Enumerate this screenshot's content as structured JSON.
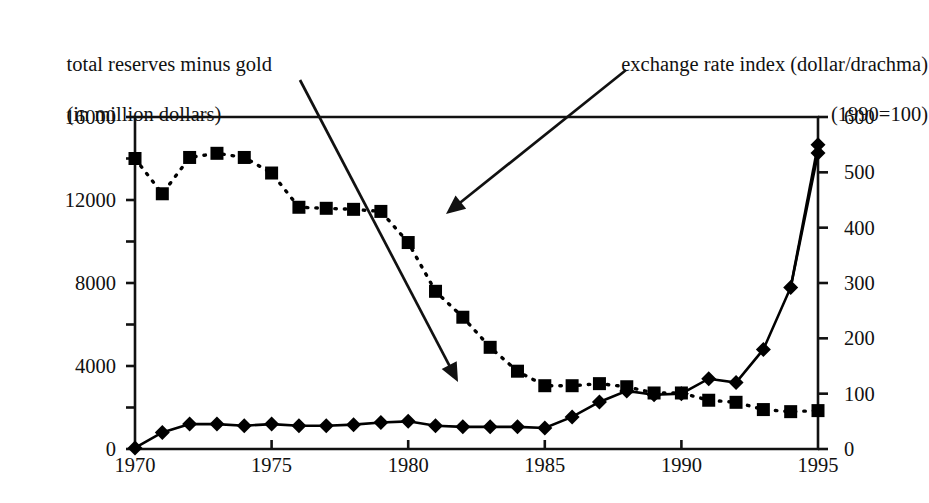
{
  "chart_data": {
    "type": "line",
    "title": "",
    "xlabel": "",
    "x": [
      1970,
      1971,
      1972,
      1973,
      1974,
      1975,
      1976,
      1977,
      1978,
      1979,
      1980,
      1981,
      1982,
      1983,
      1984,
      1985,
      1986,
      1987,
      1988,
      1989,
      1990,
      1991,
      1992,
      1993,
      1994,
      1995
    ],
    "xlim": [
      1970,
      1995
    ],
    "xticks": [
      "1970",
      "1975",
      "1980",
      "1985",
      "1990",
      "1995"
    ],
    "xtick_values": [
      1970,
      1975,
      1980,
      1985,
      1990,
      1995
    ],
    "grid": false,
    "legend_position": "annotated-with-arrows",
    "axes": [
      {
        "side": "left",
        "label": "total reserves minus gold\n(in million dollars)",
        "label_line1": "total reserves minus gold",
        "label_line2": "(in million dollars)",
        "ylim": [
          0,
          16000
        ],
        "yticks": [
          "0",
          "4000",
          "8000",
          "12000",
          "16000"
        ],
        "ytick_values": [
          0,
          4000,
          8000,
          12000,
          16000
        ]
      },
      {
        "side": "right",
        "label": "exchange rate index (dollar/drachma)\n(1990=100)",
        "label_line1": "exchange rate index (dollar/drachma)",
        "label_line2": "(1990=100)",
        "ylim": [
          0,
          600
        ],
        "yticks": [
          "0",
          "100",
          "200",
          "300",
          "400",
          "500",
          "600"
        ],
        "ytick_values": [
          0,
          100,
          200,
          300,
          400,
          500,
          600
        ]
      }
    ],
    "series": [
      {
        "name": "total reserves minus gold (in million dollars)",
        "axis": "left",
        "marker": "square",
        "linestyle": "dotted",
        "color": "#000000",
        "values": [
          14000,
          12300,
          14050,
          14250,
          14050,
          13300,
          11650,
          11600,
          11550,
          11450,
          9950,
          7600,
          6350,
          4900,
          3750,
          3050,
          3050,
          3150,
          3000,
          2700,
          2700,
          2350,
          2250,
          1900,
          1800,
          1850
        ]
      },
      {
        "name": "exchange rate index (dollar/drachma) (1990=100)",
        "axis": "right",
        "marker": "diamond",
        "linestyle": "solid",
        "color": "#000000",
        "values": [
          2,
          30,
          45,
          45,
          42,
          45,
          42,
          42,
          44,
          48,
          50,
          42,
          40,
          40,
          40,
          38,
          58,
          85,
          105,
          98,
          100,
          127,
          120,
          180,
          292,
          535
        ]
      }
    ],
    "annotations": [
      {
        "name": "arrow-to-reserves-series",
        "text": "",
        "from": [
          300,
          80
        ],
        "to": [
          458,
          382
        ],
        "points_to_series": "total reserves minus gold (in million dollars)"
      },
      {
        "name": "arrow-to-exchange-rate-series",
        "text": "",
        "from": [
          626,
          70
        ],
        "to": [
          446,
          214
        ],
        "points_to_series": "exchange rate index (dollar/drachma) (1990=100)"
      }
    ]
  }
}
